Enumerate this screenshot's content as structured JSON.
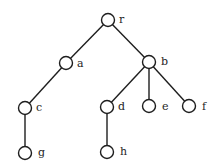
{
  "diagram": {
    "type": "rooted-tree",
    "width": 217,
    "height": 168,
    "colors": {
      "stroke": "#1e1e1e",
      "node_fill": "#ffffff",
      "label": "#1e1e1e",
      "background": "#ffffff"
    },
    "node_radius": 6.5,
    "nodes": [
      {
        "id": "r",
        "label": "r",
        "x": 108,
        "y": 20,
        "lx": 119,
        "ly": 23
      },
      {
        "id": "a",
        "label": "a",
        "x": 66,
        "y": 63,
        "lx": 77,
        "ly": 67
      },
      {
        "id": "b",
        "label": "b",
        "x": 149,
        "y": 62,
        "lx": 161,
        "ly": 65
      },
      {
        "id": "c",
        "label": "c",
        "x": 25,
        "y": 108,
        "lx": 36,
        "ly": 111
      },
      {
        "id": "d",
        "label": "d",
        "x": 107,
        "y": 107,
        "lx": 118,
        "ly": 110
      },
      {
        "id": "e",
        "label": "e",
        "x": 149,
        "y": 106,
        "lx": 162,
        "ly": 110
      },
      {
        "id": "f",
        "label": "f",
        "x": 189,
        "y": 106,
        "lx": 202,
        "ly": 110
      },
      {
        "id": "g",
        "label": "g",
        "x": 25,
        "y": 153,
        "lx": 38,
        "ly": 156
      },
      {
        "id": "h",
        "label": "h",
        "x": 107,
        "y": 152,
        "lx": 120,
        "ly": 155
      }
    ],
    "edges": [
      {
        "from": "r",
        "to": "a"
      },
      {
        "from": "r",
        "to": "b"
      },
      {
        "from": "a",
        "to": "c"
      },
      {
        "from": "b",
        "to": "d"
      },
      {
        "from": "b",
        "to": "e"
      },
      {
        "from": "b",
        "to": "f"
      },
      {
        "from": "c",
        "to": "g"
      },
      {
        "from": "d",
        "to": "h"
      }
    ]
  }
}
